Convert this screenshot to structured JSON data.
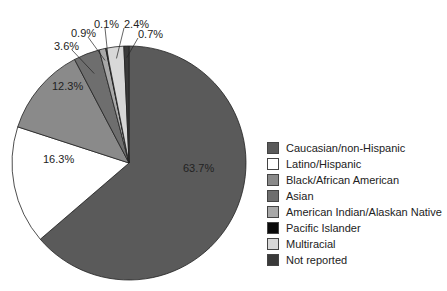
{
  "chart_data": {
    "type": "pie",
    "title": "",
    "start_angle": "12 o'clock",
    "direction": "clockwise",
    "legend_position": "right",
    "categories": [
      "Caucasian/non-Hispanic",
      "Latino/Hispanic",
      "Black/African American",
      "Asian",
      "American Indian/Alaskan Native",
      "Pacific Islander",
      "Multiracial",
      "Not reported"
    ],
    "values": [
      63.7,
      16.3,
      12.3,
      3.6,
      0.9,
      0.1,
      2.4,
      0.7
    ],
    "value_labels": [
      "63.7%",
      "16.3%",
      "12.3%",
      "3.6%",
      "0.9%",
      "0.1%",
      "2.4%",
      "0.7%"
    ],
    "colors": [
      "#5a5a5a",
      "#ffffff",
      "#8a8a8a",
      "#6e6e6e",
      "#a8a8a8",
      "#0a0a0a",
      "#d8d8d8",
      "#3a3a3a"
    ]
  },
  "legend": {
    "items": [
      {
        "label": "Caucasian/non-Hispanic",
        "color": "#5a5a5a"
      },
      {
        "label": "Latino/Hispanic",
        "color": "#ffffff"
      },
      {
        "label": "Black/African American",
        "color": "#8a8a8a"
      },
      {
        "label": "Asian",
        "color": "#6e6e6e"
      },
      {
        "label": "American Indian/Alaskan Native",
        "color": "#a8a8a8"
      },
      {
        "label": "Pacific Islander",
        "color": "#0a0a0a"
      },
      {
        "label": "Multiracial",
        "color": "#d8d8d8"
      },
      {
        "label": "Not reported",
        "color": "#3a3a3a"
      }
    ]
  }
}
